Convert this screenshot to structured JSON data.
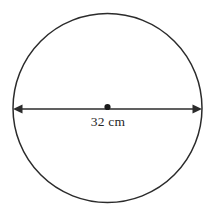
{
  "figure": {
    "name": "circle-with-diameter-label",
    "type": "geometry-diagram",
    "background_color": "#ffffff",
    "stroke_color": "#2b2b2b",
    "text_color": "#262626",
    "circle": {
      "center_x": 107.5,
      "center_y": 108,
      "radius": 94.5,
      "stroke_width": 1.5
    },
    "center_point": {
      "label": "",
      "radius": 3.1
    },
    "diameter": {
      "label": "32 cm",
      "value": 32,
      "unit": "cm",
      "x_start": 13,
      "x_end": 202,
      "y": 109,
      "stroke_width": 1.7,
      "arrowheads": "both"
    },
    "label_position": {
      "x": 108,
      "y": 126
    }
  }
}
